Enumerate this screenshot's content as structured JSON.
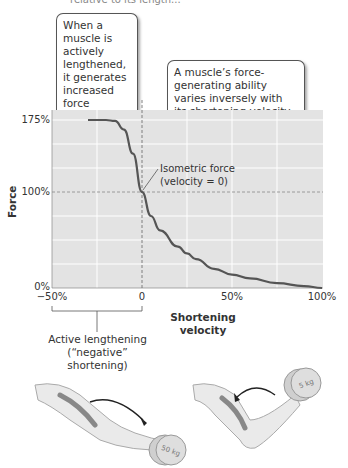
{
  "header": {
    "cut_text": "relative to its length..."
  },
  "callouts": {
    "lengthening": "When a muscle is actively lengthened, it generates increased force (lengthening contraction).",
    "inverse": "A muscle’s force-generating ability varies inversely with its shortening velocity."
  },
  "annotations": {
    "isometric_line1": "Isometric force",
    "isometric_line2": "(velocity = 0)",
    "active_line1": "Active lengthening",
    "active_line2": "(“negative” shortening)"
  },
  "illustrations": {
    "left_weight": "50 kg",
    "right_weight": "5 kg"
  },
  "chart_data": {
    "type": "line",
    "title": "",
    "xlabel": "Shortening velocity",
    "ylabel": "Force",
    "x_ticks": [
      "−50%",
      "0",
      "50%",
      "100%"
    ],
    "y_ticks": [
      "0%",
      "100%",
      "175%"
    ],
    "xlim": [
      -50,
      100
    ],
    "ylim": [
      0,
      175
    ],
    "grid": true,
    "reference_lines": {
      "x": 0,
      "y": 100
    },
    "series": [
      {
        "name": "Force-velocity curve",
        "x": [
          -30,
          -20,
          -15,
          -10,
          -5,
          0,
          5,
          10,
          20,
          25,
          30,
          40,
          50,
          60,
          75,
          90,
          100
        ],
        "y": [
          175,
          175,
          174,
          165,
          140,
          100,
          75,
          60,
          43,
          36,
          30,
          20,
          14,
          10,
          5,
          2,
          0
        ]
      }
    ],
    "colors": {
      "plot_bg": "#e3e3e3",
      "grid": "#ffffff",
      "curve": "#555555"
    }
  }
}
